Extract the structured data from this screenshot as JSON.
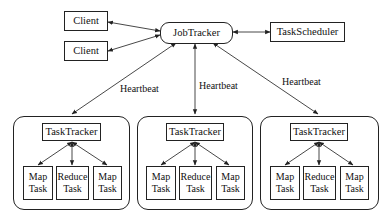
{
  "diagram": {
    "clients": [
      {
        "label": "Client"
      },
      {
        "label": "Client"
      }
    ],
    "job_tracker": {
      "label": "JobTracker"
    },
    "task_scheduler": {
      "label": "TaskScheduler"
    },
    "heartbeat_labels": [
      "Heartbeat",
      "Heartbeat",
      "Heartbeat"
    ],
    "nodes": [
      {
        "task_tracker": "TaskTracker",
        "tasks": [
          {
            "line1": "Map",
            "line2": "Task"
          },
          {
            "line1": "Reduce",
            "line2": "Task"
          },
          {
            "line1": "Map",
            "line2": "Task"
          }
        ]
      },
      {
        "task_tracker": "TaskTracker",
        "tasks": [
          {
            "line1": "Map",
            "line2": "Task"
          },
          {
            "line1": "Reduce",
            "line2": "Task"
          },
          {
            "line1": "Map",
            "line2": "Task"
          }
        ]
      },
      {
        "task_tracker": "TaskTracker",
        "tasks": [
          {
            "line1": "Map",
            "line2": "Task"
          },
          {
            "line1": "Reduce",
            "line2": "Task"
          },
          {
            "line1": "Map",
            "line2": "Task"
          }
        ]
      }
    ],
    "edges": [
      {
        "from": "Client",
        "to": "JobTracker",
        "type": "bidirectional"
      },
      {
        "from": "Client",
        "to": "JobTracker",
        "type": "bidirectional"
      },
      {
        "from": "JobTracker",
        "to": "TaskScheduler",
        "type": "bidirectional"
      },
      {
        "from": "JobTracker",
        "to": "TaskTracker 1",
        "type": "bidirectional",
        "label": "Heartbeat"
      },
      {
        "from": "JobTracker",
        "to": "TaskTracker 2",
        "type": "bidirectional",
        "label": "Heartbeat"
      },
      {
        "from": "JobTracker",
        "to": "TaskTracker 3",
        "type": "bidirectional",
        "label": "Heartbeat"
      },
      {
        "from": "TaskTracker",
        "to": "Map Task",
        "type": "bidirectional"
      },
      {
        "from": "TaskTracker",
        "to": "Reduce Task",
        "type": "bidirectional"
      },
      {
        "from": "TaskTracker",
        "to": "Map Task",
        "type": "bidirectional"
      }
    ]
  }
}
